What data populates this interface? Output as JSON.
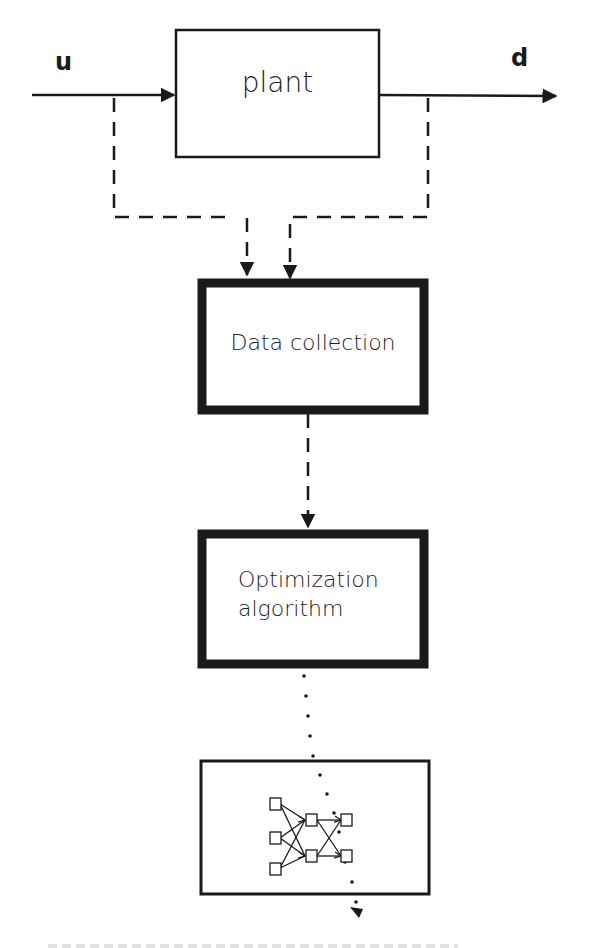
{
  "diagram": {
    "signals": {
      "input": "u",
      "output": "d"
    },
    "blocks": {
      "plant": "plant",
      "data_collection": "Data collection",
      "optimization_line1": "Optimization",
      "optimization_line2": "algorithm"
    },
    "neural_network": {
      "layers": [
        3,
        2,
        2
      ],
      "icon": "neural-network-icon"
    },
    "connectors": {
      "input_to_plant": "solid-arrow",
      "plant_to_output": "solid-arrow",
      "taps_to_data_collection": "dashed-arrows",
      "data_collection_to_optimization": "dashed-arrow",
      "optimization_to_network": "dotted-arrow"
    },
    "colors": {
      "line": "#1a1a1a",
      "background": "#ffffff"
    }
  }
}
